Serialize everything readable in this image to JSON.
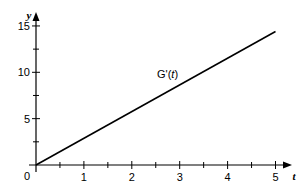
{
  "chart_data": {
    "type": "line",
    "title": "",
    "xlabel": "t",
    "ylabel": "y",
    "xlim": [
      0,
      5.3
    ],
    "ylim": [
      0,
      16
    ],
    "grid": false,
    "x_ticks": [
      0,
      1,
      2,
      3,
      4,
      5
    ],
    "x_tick_labels": [
      "0",
      "1",
      "2",
      "3",
      "4",
      "5"
    ],
    "x_minor_ticks": [
      0.5,
      1.5,
      2.5,
      3.5,
      4.5
    ],
    "y_ticks": [
      5,
      10,
      15
    ],
    "y_tick_labels": [
      "5",
      "10",
      "15"
    ],
    "y_minor_ticks": [
      2.5,
      7.5,
      12.5
    ],
    "series": [
      {
        "name": "G'(t)",
        "x": [
          0,
          5
        ],
        "values": [
          0,
          14.4
        ],
        "color": "#000000"
      }
    ],
    "annotations": [
      {
        "text": "G'(t)",
        "x": 2.6,
        "y": 9.6
      }
    ],
    "legend": "none"
  },
  "labels": {
    "origin": "0",
    "x_axis_var": "t",
    "y_axis_var": "y",
    "series_label_prefix": "G'(",
    "series_label_var": "t",
    "series_label_suffix": ")"
  }
}
